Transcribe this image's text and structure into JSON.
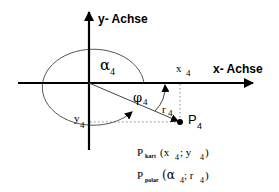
{
  "diagram": {
    "type": "coordinate-system",
    "colors": {
      "stroke": "#000000",
      "curve": "#555555",
      "dotted": "#888888",
      "background": "#ffffff"
    },
    "axes": {
      "x_label": "x- Achse",
      "y_label": "y- Achse"
    },
    "labels": {
      "alpha": "α",
      "alpha_sub": "4",
      "phi": "φ",
      "phi_sub": "4",
      "r": "r",
      "r_sub": "4",
      "x": "x",
      "x_sub": "4",
      "y": "y",
      "y_sub": "4",
      "point": "P",
      "point_sub": "4"
    },
    "formulas": {
      "cartesian": {
        "P": "P",
        "sub": "kart",
        "open": "(x",
        "x_sub": "4",
        "sep": "; y",
        "y_sub": "4",
        "close": ")"
      },
      "polar": {
        "P": "P",
        "sub": "polar",
        "open": "(α",
        "a_sub": "4",
        "sep": "; r",
        "r_sub": "4",
        "close": ")"
      }
    }
  }
}
